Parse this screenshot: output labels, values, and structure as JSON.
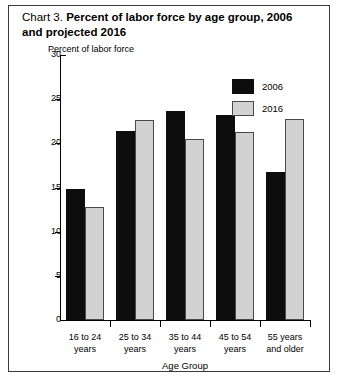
{
  "title": {
    "prefix": "Chart 3.",
    "main": "Percent of labor force by age group, 2006 and projected 2016"
  },
  "legend": {
    "entries": [
      {
        "label": "2006",
        "color": "#0d0d0d"
      },
      {
        "label": "2016",
        "color": "#d2d2d2"
      }
    ]
  },
  "axis": {
    "y_title": "Percent of labor force",
    "x_title": "Age Group",
    "y_ticks": [
      "30",
      "25",
      "20",
      "15",
      "10",
      "5",
      "0"
    ]
  },
  "categories": [
    {
      "line1": "16 to 24",
      "line2": "years"
    },
    {
      "line1": "25 to 34",
      "line2": "years"
    },
    {
      "line1": "35 to 44",
      "line2": "years"
    },
    {
      "line1": "45 to 54",
      "line2": "years"
    },
    {
      "line1": "55 years",
      "line2": "and older"
    }
  ],
  "chart_data": {
    "type": "bar",
    "title": "Chart 3. Percent of labor force by age group, 2006 and projected 2016",
    "xlabel": "Age Group",
    "ylabel": "Percent of labor force",
    "ylim": [
      0,
      30
    ],
    "ytick_values": [
      0,
      5,
      10,
      15,
      20,
      25,
      30
    ],
    "grid": false,
    "legend_position": "top-right",
    "categories": [
      "16 to 24 years",
      "25 to 34 years",
      "35 to 44 years",
      "45 to 54 years",
      "55 years and older"
    ],
    "series": [
      {
        "name": "2006",
        "color": "#0d0d0d",
        "values": [
          14.8,
          21.4,
          23.7,
          23.2,
          16.7
        ]
      },
      {
        "name": "2016",
        "color": "#d2d2d2",
        "values": [
          12.8,
          22.6,
          20.5,
          21.3,
          22.7
        ]
      }
    ]
  }
}
